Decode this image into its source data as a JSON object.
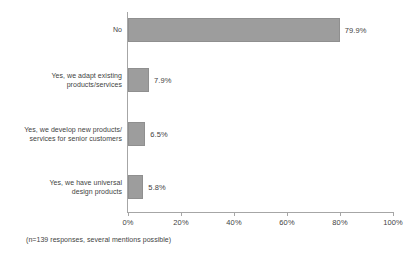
{
  "chart_data": {
    "type": "bar",
    "orientation": "horizontal",
    "title": "",
    "xlabel": "",
    "ylabel": "",
    "xlim": [
      0,
      100
    ],
    "grid": false,
    "legend": null,
    "categories": [
      "No",
      "Yes, we adapt existing\nproducts/services",
      "Yes, we develop new products/\nservices for senior customers",
      "Yes, we have universal\ndesign products"
    ],
    "values": [
      79.9,
      7.9,
      6.5,
      5.8
    ],
    "value_labels": [
      "79.9%",
      "7.9%",
      "6.5%",
      "5.8%"
    ],
    "xticks": [
      0,
      20,
      40,
      60,
      80,
      100
    ],
    "xtick_labels": [
      "0%",
      "20%",
      "40%",
      "60%",
      "80%",
      "100%"
    ],
    "annotation": "(n=139 responses, several mentions possible)",
    "bar_color": "#9d9d9d",
    "axis_color": "#a6a6a6",
    "text_color": "#3f3f3f"
  }
}
